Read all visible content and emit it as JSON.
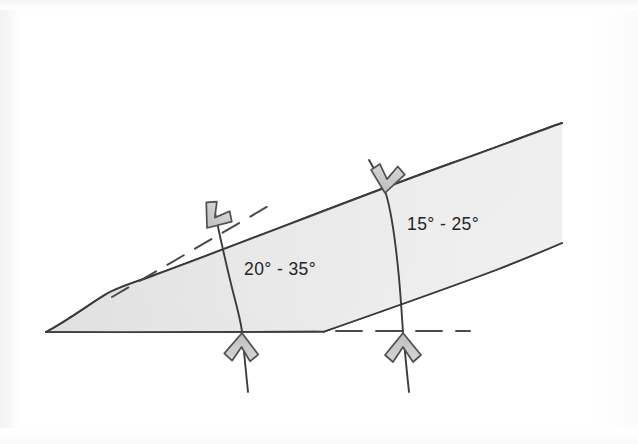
{
  "figure": {
    "background_color": "#ffffff",
    "ink_color": "#3a3a3a",
    "band_fill_color": "#ebebeb",
    "wedge_fill_color": "#e4e4e4",
    "arrow_fill_color": "#c9c9c9",
    "arrow_stroke_color": "#4a4a4a"
  },
  "labels": {
    "lower_angle_range": "20° - 35°",
    "upper_angle_range": "15° - 25°"
  },
  "annotations": {
    "ground_line_name": "ground-surface-line",
    "upper_boundary_name": "upper-slope-boundary-line",
    "lower_boundary_name": "lower-slope-boundary-line",
    "dashed_upper_name": "dashed-reference-line-upper",
    "dashed_lower_name": "dashed-reference-line-lower"
  },
  "arrows": [
    {
      "id": "arrow-upper-left",
      "direction": "down-right",
      "description": "chevron arrow pointing down-right onto left slip surface"
    },
    {
      "id": "arrow-upper-right",
      "direction": "down",
      "description": "chevron arrow pointing down onto upper boundary"
    },
    {
      "id": "arrow-lower-left",
      "direction": "up",
      "description": "chevron arrow pointing up at ground line, left slip surface"
    },
    {
      "id": "arrow-lower-right",
      "direction": "up",
      "description": "chevron arrow pointing up at ground line, right slip surface"
    }
  ],
  "slip_surfaces": [
    {
      "id": "slip-surface-left",
      "description": "curved line crossing the band on the left"
    },
    {
      "id": "slip-surface-right",
      "description": "curved line crossing the band on the right"
    }
  ]
}
